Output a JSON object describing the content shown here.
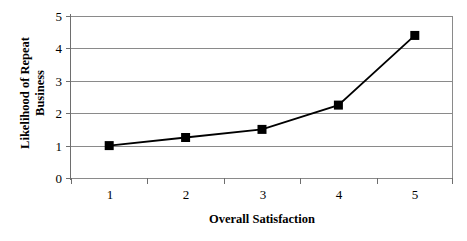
{
  "chart_data": {
    "type": "line",
    "title": "",
    "xlabel": "Overall Satisfaction",
    "ylabel": "Likelihood of Repeat Business",
    "ylabel_line1": "Likelihood of Repeat",
    "ylabel_line2": "Business",
    "categories": [
      "1",
      "2",
      "3",
      "4",
      "5"
    ],
    "x": [
      1,
      2,
      3,
      4,
      5
    ],
    "values": [
      1.0,
      1.25,
      1.5,
      2.25,
      4.4
    ],
    "series": [
      {
        "name": "Likelihood of Repeat Business",
        "values": [
          1.0,
          1.25,
          1.5,
          2.25,
          4.4
        ],
        "marker": "square",
        "marker_color": "#000000",
        "line_color": "#000000"
      }
    ],
    "xlim": [
      0.5,
      5.5
    ],
    "ylim": [
      0,
      5
    ],
    "y_ticks": [
      0,
      1,
      2,
      3,
      4,
      5
    ],
    "y_tick_labels": [
      "0",
      "1",
      "2",
      "3",
      "4",
      "5"
    ],
    "x_ticks": [
      1,
      2,
      3,
      4,
      5
    ],
    "x_tick_labels": [
      "1",
      "2",
      "3",
      "4",
      "5"
    ],
    "grid": "horizontal",
    "grid_color": "#8a8a8a",
    "legend": "none",
    "background": "#ffffff"
  },
  "axes": {
    "y_labels": [
      "5",
      "4",
      "3",
      "2",
      "1",
      "0"
    ],
    "x_labels": [
      "1",
      "2",
      "3",
      "4",
      "5"
    ]
  }
}
